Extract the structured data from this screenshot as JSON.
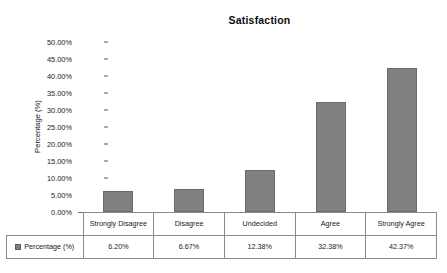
{
  "chart_data": {
    "type": "bar",
    "title": "Satisfaction",
    "xlabel": "",
    "ylabel": "Percentage (%)",
    "categories": [
      "Strongly Disagree",
      "Disagree",
      "Undecided",
      "Agree",
      "Strongly Agree"
    ],
    "values": [
      6.2,
      6.67,
      12.38,
      32.38,
      42.37
    ],
    "value_labels": [
      "6.20%",
      "6.67%",
      "12.38%",
      "32.38%",
      "42.37%"
    ],
    "series": [
      {
        "name": "Percentage (%)",
        "values": [
          6.2,
          6.67,
          12.38,
          32.38,
          42.37
        ]
      }
    ],
    "ylim": [
      0,
      50
    ],
    "ytick_labels": [
      "50.00%",
      "45.00%",
      "40.00%",
      "35.00%",
      "30.00%",
      "25.00%",
      "20.00%",
      "15.00%",
      "10.00%",
      "5.00%",
      "0.00%"
    ],
    "ytick_values": [
      50,
      45,
      40,
      35,
      30,
      25,
      20,
      15,
      10,
      5,
      0
    ],
    "grid": false,
    "legend": {
      "position": "bottom-table",
      "entries": [
        {
          "label": "Percentage (%)",
          "color": "#808080"
        }
      ]
    },
    "bar_color": "#808080",
    "bar_border_color": "#6a6a6a",
    "has_data_table": true,
    "data_table": {
      "row_label": "Percentage (%)",
      "header_row": [
        "Strongly Disagree",
        "Disagree",
        "Undecided",
        "Agree",
        "Strongly Agree"
      ],
      "value_row": [
        "6.20%",
        "6.67%",
        "12.38%",
        "32.38%",
        "42.37%"
      ]
    }
  }
}
